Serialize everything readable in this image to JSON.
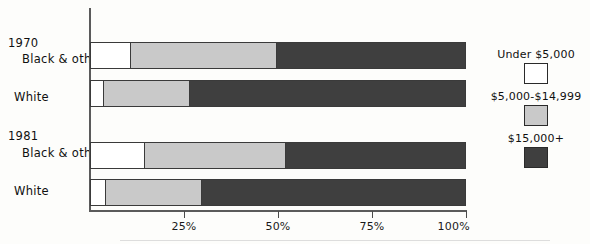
{
  "chart_data": {
    "type": "bar",
    "orientation": "horizontal",
    "stacked": true,
    "percent": true,
    "title": "",
    "subtitle": "",
    "xlabel": "",
    "ylabel": "",
    "xlim": [
      0,
      100
    ],
    "grid": false,
    "legend_position": "right",
    "axis_ticks": [
      {
        "value": 25,
        "label": "25%"
      },
      {
        "value": 50,
        "label": "50%"
      },
      {
        "value": 75,
        "label": "75%"
      },
      {
        "value": 100,
        "label": "100%"
      }
    ],
    "series": [
      {
        "name": "Under $5,000",
        "key": "under",
        "color": "#ffffff",
        "values": [
          10.6,
          3.5,
          14.4,
          4.0
        ]
      },
      {
        "name": "$5,000-$14,999",
        "key": "mid",
        "color": "#c9c9c9",
        "values": [
          38.9,
          22.8,
          37.5,
          25.5
        ]
      },
      {
        "name": "$15,000+",
        "key": "high",
        "color": "#3f3f3f",
        "values": [
          50.5,
          73.7,
          48.1,
          70.5
        ]
      }
    ],
    "groups": [
      {
        "label": "1970",
        "categories": [
          "Black & other",
          "White"
        ]
      },
      {
        "label": "1981",
        "categories": [
          "Black & other",
          "White"
        ]
      }
    ],
    "bars": [
      {
        "group": "1970",
        "category": "Black & other",
        "under": 10.6,
        "mid": 38.9,
        "high": 50.5
      },
      {
        "group": "1970",
        "category": "White",
        "under": 3.5,
        "mid": 22.8,
        "high": 73.7
      },
      {
        "group": "1981",
        "category": "Black & other",
        "under": 14.4,
        "mid": 37.5,
        "high": 48.1
      },
      {
        "group": "1981",
        "category": "White",
        "under": 4.0,
        "mid": 25.5,
        "high": 70.5
      }
    ]
  },
  "labels": {
    "group_1970": "1970",
    "group_1981": "1981",
    "cat_1970_black": "Black & other",
    "cat_1970_white": "White",
    "cat_1981_black": "Black & other",
    "cat_1981_white": "White"
  },
  "ticks": {
    "t25": "25%",
    "t50": "50%",
    "t75": "75%",
    "t100": "100%"
  },
  "legend": {
    "under": "Under $5,000",
    "mid": "$5,000-$14,999",
    "high": "$15,000+"
  },
  "colors": {
    "under": "#ffffff",
    "mid": "#c9c9c9",
    "high": "#3f3f3f",
    "axis": "#5b5b5b",
    "outline": "#3a3a3a",
    "background": "#fdfdfb"
  }
}
